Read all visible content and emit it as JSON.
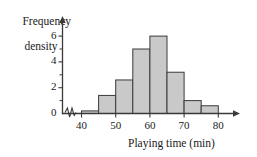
{
  "chart_data": {
    "type": "bar",
    "title": "",
    "subtitle": "",
    "xlabel": "Playing time (min)",
    "ylabel_line1": "Frequency",
    "ylabel_line2": "density",
    "ylabel": "Frequency density",
    "xlim": [
      37,
      81
    ],
    "ylim": [
      0,
      6.6
    ],
    "xticks": [
      40,
      50,
      60,
      70,
      80
    ],
    "xtick_labels": [
      "40",
      "50",
      "60",
      "70",
      "80"
    ],
    "yticks": [
      0,
      2,
      4,
      6
    ],
    "ytick_labels": [
      "0",
      "2",
      "4",
      "6"
    ],
    "y_minor_ticks": [
      1,
      3,
      5
    ],
    "grid": false,
    "legend": "none",
    "axis_break": true,
    "bin_edges": [
      40,
      45,
      50,
      55,
      60,
      65,
      70,
      75,
      80
    ],
    "categories": [
      "40-45",
      "45-50",
      "50-55",
      "55-60",
      "60-65",
      "65-70",
      "70-75",
      "75-80"
    ],
    "values": [
      0.2,
      1.4,
      2.6,
      5.0,
      6.0,
      3.2,
      1.0,
      0.6
    ],
    "bar_fill": "#c9c9c9",
    "bar_edge": "#3a3a3a",
    "axis_color": "#3a3a3a"
  }
}
